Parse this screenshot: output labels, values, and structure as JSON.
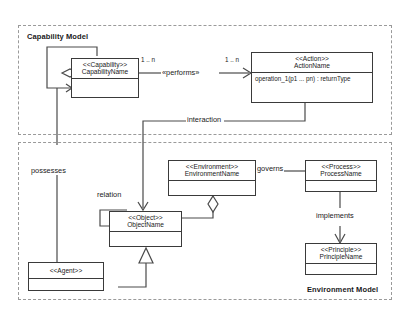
{
  "diagram": {
    "packages": [
      {
        "id": "capability-model",
        "label": "Capability Model"
      },
      {
        "id": "environment-model",
        "label": "Environment Model"
      }
    ]
  },
  "classes": {
    "capability": {
      "stereotype": "<<Capability>>",
      "name": "CapabilityName"
    },
    "action": {
      "stereotype": "<<Action>>",
      "name": "ActionName",
      "operation": "operation_1(p1 ... pn) : returnType"
    },
    "environment": {
      "stereotype": "<<Environment>>",
      "name": "EnvironmentName"
    },
    "process": {
      "stereotype": "<<Process>>",
      "name": "ProcessName"
    },
    "principle": {
      "stereotype": "<<Principle>>",
      "name": "PrincipleName"
    },
    "object": {
      "stereotype": "<<Object>>",
      "name": "ObjectName"
    },
    "agent": {
      "stereotype": "<<Agent>>",
      "name": ""
    }
  },
  "relations": {
    "performs": {
      "label": "«performs»",
      "source_multiplicity": "1 .. n",
      "target_multiplicity": "1 .. n"
    },
    "interaction": {
      "label": "interaction"
    },
    "possesses": {
      "label": "possesses"
    },
    "relation": {
      "label": "relation"
    },
    "governs": {
      "label": "governs"
    },
    "implements": {
      "label": "implements"
    }
  },
  "colors": {
    "stroke": "#4a4a4a",
    "box_border": "#3a3a3a",
    "package_border": "#9a9a9a",
    "text": "#1a1a1a",
    "background": "#ffffff"
  }
}
